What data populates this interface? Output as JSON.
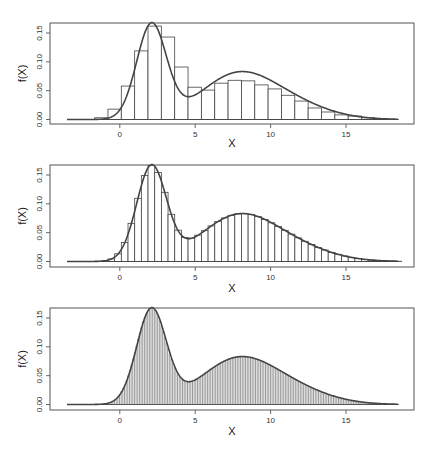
{
  "chart_data": [
    {
      "type": "bar",
      "subtype": "histogram-with-density-curve",
      "title": "",
      "xlabel": "X",
      "ylabel": "f(X)",
      "xlim": [
        -4.6,
        19
      ],
      "ylim": [
        -0.008,
        0.168
      ],
      "x_ticks": [
        0,
        5,
        10,
        15
      ],
      "x_tick_labels": [
        "0",
        "5",
        "10",
        "15"
      ],
      "y_ticks": [
        0.0,
        0.05,
        0.1,
        0.15
      ],
      "y_tick_labels": [
        "0.00",
        "0.05",
        "0.10",
        "0.15"
      ],
      "grid": false,
      "bin_width": 0.885,
      "bin_start": -1.67,
      "bin_heights": [
        0.003,
        0.018,
        0.058,
        0.119,
        0.162,
        0.143,
        0.091,
        0.056,
        0.051,
        0.063,
        0.068,
        0.067,
        0.06,
        0.053,
        0.042,
        0.032,
        0.02,
        0.013,
        0.008,
        0.006,
        0.003,
        0.001
      ]
    },
    {
      "type": "bar",
      "subtype": "histogram-with-density-curve",
      "title": "",
      "xlabel": "X",
      "ylabel": "f(X)",
      "xlim": [
        -4.6,
        19
      ],
      "ylim": [
        -0.008,
        0.168
      ],
      "x_ticks": [
        0,
        5,
        10,
        15
      ],
      "x_tick_labels": [
        "0",
        "5",
        "10",
        "15"
      ],
      "y_ticks": [
        0.0,
        0.05,
        0.1,
        0.15
      ],
      "y_tick_labels": [
        "0.00",
        "0.05",
        "0.10",
        "0.15"
      ],
      "grid": false,
      "bin_width": 0.4425,
      "bin_start": -2.11,
      "bin_heights": "computed-from-density"
    },
    {
      "type": "bar",
      "subtype": "histogram-with-density-curve",
      "title": "",
      "xlabel": "X",
      "ylabel": "f(X)",
      "xlim": [
        -4.6,
        19
      ],
      "ylim": [
        -0.008,
        0.168
      ],
      "x_ticks": [
        0,
        5,
        10,
        15
      ],
      "x_tick_labels": [
        "0",
        "5",
        "10",
        "15"
      ],
      "y_ticks": [
        0.0,
        0.05,
        0.1,
        0.15
      ],
      "y_tick_labels": [
        "0.00",
        "0.05",
        "0.10",
        "0.15"
      ],
      "grid": false,
      "bin_width": 0.11,
      "bin_start": -2.0,
      "bin_heights": "computed-from-density"
    }
  ],
  "density": {
    "description": "Bimodal mixture density f(X): sharp mode near X=2.1 (f≈0.162), local min near X=5.2 (f≈0.049), broad mode near X=7.6 (f≈0.068), right tail to ~X=18",
    "components": [
      {
        "weight": 0.4,
        "mean": 2.1,
        "sd": 0.98
      },
      {
        "weight": 0.42,
        "mean": 7.6,
        "sd": 2.4
      },
      {
        "weight": 0.18,
        "mean": 11.0,
        "sd": 2.6
      }
    ],
    "x_range": [
      -3.5,
      18.5
    ]
  },
  "panels": [
    {
      "ylabel": "f(X)",
      "xlabel": "X"
    },
    {
      "ylabel": "f(X)",
      "xlabel": "X"
    },
    {
      "ylabel": "f(X)",
      "xlabel": "X"
    }
  ]
}
